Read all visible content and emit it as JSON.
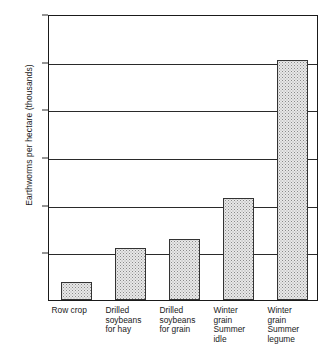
{
  "chart_data": {
    "type": "bar",
    "title": "",
    "xlabel": "",
    "ylabel": "Earthworms per hectare (thousands)",
    "categories": [
      "Row crop",
      "Drilled\nsoybeans\nfor hay",
      "Drilled\nsoybeans\nfor grain",
      "Winter\ngrain\nSummer\nidle",
      "Winter\ngrain\nSummer\nlegume"
    ],
    "values": [
      85,
      238,
      280,
      470,
      1110
    ],
    "ylim": [
      0,
      1320
    ],
    "yticks": [
      220,
      440,
      660,
      880,
      1100,
      1320
    ],
    "ytick_labels": [
      "220",
      "440",
      "660",
      "880",
      "1100",
      "1320"
    ],
    "grid": true,
    "legend": false,
    "bar_fill": "#e8e8e8",
    "bar_edge": "#333333",
    "axis_color": "#1a1a1a",
    "background": "#ffffff"
  },
  "axis": {
    "y_title": "Earthworms per hectare (thousands)"
  },
  "bars": [
    {
      "label": "Row crop",
      "value": 85
    },
    {
      "label": "Drilled\nsoybeans\nfor hay",
      "value": 238
    },
    {
      "label": "Drilled\nsoybeans\nfor grain",
      "value": 280
    },
    {
      "label": "Winter\ngrain\nSummer\nidle",
      "value": 470
    },
    {
      "label": "Winter\ngrain\nSummer\nlegume",
      "value": 1110
    }
  ],
  "yticks": [
    {
      "label": "1320",
      "value": 1320
    },
    {
      "label": "1100",
      "value": 1100
    },
    {
      "label": "880",
      "value": 880
    },
    {
      "label": "660",
      "value": 660
    },
    {
      "label": "440",
      "value": 440
    },
    {
      "label": "220",
      "value": 220
    }
  ]
}
